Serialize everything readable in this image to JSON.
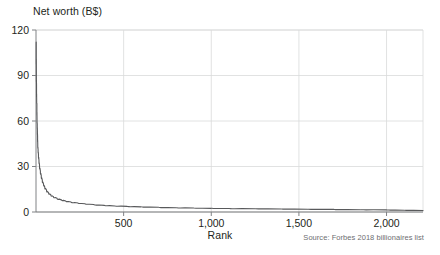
{
  "chart_data": {
    "type": "line",
    "title": "",
    "ylabel": "Net worth (B$)",
    "xlabel": "Rank",
    "source": "Source: Forbes 2018 billionaires list",
    "xlim": [
      0,
      2208
    ],
    "ylim": [
      0,
      120
    ],
    "grid": true,
    "legend": "none",
    "line_color": "#58595b",
    "grid_color": "#d9dadb",
    "axis_color": "#808285",
    "yticks": [
      0,
      30,
      60,
      90,
      120
    ],
    "ytick_labels": [
      "0",
      "30",
      "60",
      "90",
      "120"
    ],
    "xticks": [
      500,
      1000,
      1500,
      2000
    ],
    "xtick_labels": [
      "500",
      "1,000",
      "1,500",
      "2,000"
    ],
    "series": [
      {
        "name": "Net worth by rank",
        "x": [
          1,
          2,
          3,
          4,
          5,
          6,
          7,
          8,
          9,
          10,
          12,
          14,
          17,
          20,
          25,
          30,
          36,
          43,
          50,
          60,
          72,
          85,
          100,
          120,
          145,
          170,
          200,
          240,
          280,
          330,
          390,
          450,
          520,
          600,
          700,
          800,
          900,
          1000,
          1100,
          1250,
          1400,
          1550,
          1700,
          1850,
          2000,
          2100,
          2208
        ],
        "y": [
          112,
          90,
          84,
          72,
          71.5,
          60,
          58,
          53.5,
          50,
          44.5,
          41,
          38,
          34,
          31,
          27,
          24,
          21,
          18.5,
          16.5,
          14.5,
          12.6,
          11.2,
          10.1,
          9.0,
          8.0,
          7.3,
          6.6,
          5.9,
          5.4,
          4.9,
          4.4,
          4.0,
          3.7,
          3.4,
          3.1,
          2.8,
          2.6,
          2.4,
          2.3,
          2.1,
          2.0,
          1.8,
          1.7,
          1.5,
          1.4,
          1.2,
          1.0
        ]
      }
    ]
  },
  "layout": {
    "plot_left": 36,
    "plot_right": 423,
    "plot_top": 30,
    "plot_bottom": 212
  }
}
